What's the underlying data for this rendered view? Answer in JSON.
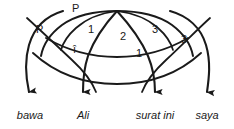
{
  "figure": {
    "type": "dependency-arc-diagram",
    "language": "Indonesian",
    "sentence": "bawa Ali surat ini saya",
    "ink_color": "#1a1a1a",
    "background_color": "#ffffff"
  },
  "words": [
    {
      "id": "w1",
      "text": "bawa",
      "x": 30,
      "y": 116
    },
    {
      "id": "w2",
      "text": "Ali",
      "x": 83,
      "y": 116
    },
    {
      "id": "w3",
      "text": "surat ini",
      "x": 155,
      "y": 116
    },
    {
      "id": "w4",
      "text": "saya",
      "x": 207,
      "y": 116
    }
  ],
  "arrows": [
    {
      "id": "a1",
      "target": "bawa",
      "tip_x": 30,
      "tip_y": 101
    },
    {
      "id": "a2",
      "target": "Ali",
      "tip_x": 83,
      "tip_y": 101
    },
    {
      "id": "a3",
      "target": "surat ini",
      "tip_x": 155,
      "tip_y": 101
    },
    {
      "id": "a4",
      "target": "saya",
      "tip_x": 207,
      "tip_y": 101
    }
  ],
  "arc_labels": [
    {
      "id": "l1",
      "text": "P",
      "x": 72,
      "y": 3
    },
    {
      "id": "l2",
      "text": "P",
      "x": 36,
      "y": 24
    },
    {
      "id": "l3",
      "text": "1",
      "x": 88,
      "y": 24
    },
    {
      "id": "l4",
      "text": "2",
      "x": 120,
      "y": 31
    },
    {
      "id": "l5",
      "text": "3",
      "x": 152,
      "y": 24
    },
    {
      "id": "l6",
      "text": "3",
      "x": 181,
      "y": 34
    },
    {
      "id": "l7",
      "text": "î",
      "x": 73,
      "y": 44
    },
    {
      "id": "l8",
      "text": "1",
      "x": 136,
      "y": 48
    }
  ],
  "curves": {
    "apex_x": 117,
    "apex_y": 11,
    "description": "nested arcs converging at top-centre apex with four descending arrowed strokes"
  }
}
